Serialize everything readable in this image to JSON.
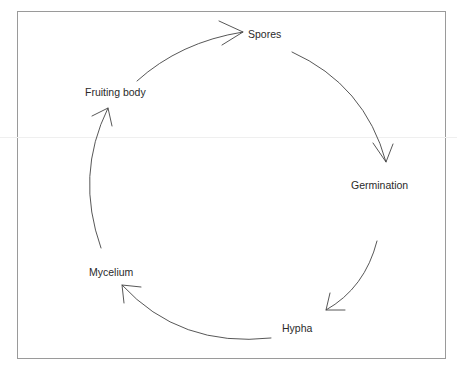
{
  "diagram": {
    "type": "cycle",
    "stages": [
      {
        "id": "spores",
        "label": "Spores"
      },
      {
        "id": "germination",
        "label": "Germination"
      },
      {
        "id": "hypha",
        "label": "Hypha"
      },
      {
        "id": "mycelium",
        "label": "Mycelium"
      },
      {
        "id": "fruiting-body",
        "label": "Fruiting body"
      }
    ],
    "edges": [
      {
        "from": "Spores",
        "to": "Germination"
      },
      {
        "from": "Germination",
        "to": "Hypha"
      },
      {
        "from": "Hypha",
        "to": "Mycelium"
      },
      {
        "from": "Mycelium",
        "to": "Fruiting body"
      },
      {
        "from": "Fruiting body",
        "to": "Spores"
      }
    ],
    "colors": {
      "stroke": "#444444",
      "text": "#2a2a2a",
      "frame": "#9a9a9a"
    }
  }
}
